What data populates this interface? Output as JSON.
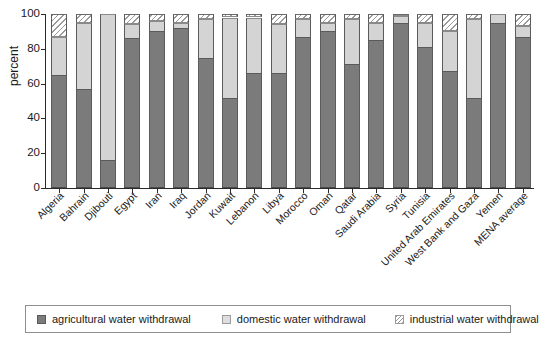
{
  "chart_data": {
    "type": "bar",
    "title": "",
    "subtitle": "",
    "xlabel": "",
    "ylabel": "percent",
    "ylim": [
      0,
      100
    ],
    "yticks": [
      0,
      20,
      40,
      60,
      80,
      100
    ],
    "grid": false,
    "stacked": true,
    "stack_total": 100,
    "legend_position": "bottom",
    "categories": [
      "Algeria",
      "Bahrain",
      "Djibouti",
      "Egypt",
      "Iran",
      "Iraq",
      "Jordan",
      "Kuwait",
      "Lebanon",
      "Libya",
      "Morocco",
      "Oman",
      "Qatar",
      "Saudi Arabia",
      "Syria",
      "Tunisia",
      "United Arab Emirates",
      "West Bank and Gaza",
      "Yemen",
      "MENA average"
    ],
    "series": [
      {
        "name": "agricultural water withdrawal",
        "color": "#7b7b7b",
        "pattern": "solid",
        "values": [
          65,
          57,
          16,
          86,
          90,
          92,
          75,
          52,
          66,
          66,
          87,
          90,
          71,
          85,
          95,
          81,
          67,
          52,
          95,
          87
        ]
      },
      {
        "name": "domestic water withdrawal",
        "color": "#d4d4d4",
        "pattern": "solid",
        "values": [
          22,
          38,
          84,
          8,
          6,
          3,
          22,
          46,
          32,
          28,
          10,
          5,
          26,
          10,
          4,
          14,
          23,
          45,
          5,
          6
        ]
      },
      {
        "name": "industrial water withdrawal",
        "color": "#ffffff",
        "pattern": "diagonal-hatch",
        "values": [
          13,
          5,
          0,
          6,
          4,
          5,
          3,
          2,
          2,
          6,
          3,
          5,
          3,
          5,
          1,
          5,
          10,
          3,
          0,
          7
        ]
      }
    ]
  },
  "axis": {
    "y_label": "percent",
    "y_tick_labels": [
      "0",
      "20",
      "40",
      "60",
      "80",
      "100"
    ]
  },
  "legend": {
    "items": [
      {
        "label": "agricultural water withdrawal",
        "swatch": "agri-swatch-icon"
      },
      {
        "label": "domestic water withdrawal",
        "swatch": "domestic-swatch-icon"
      },
      {
        "label": "industrial water withdrawal",
        "swatch": "industrial-swatch-icon"
      }
    ]
  }
}
